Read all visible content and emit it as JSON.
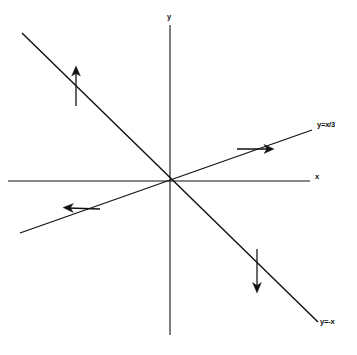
{
  "figure": {
    "kind": "phase-plane-eigenline-diagram",
    "background_color": "#ffffff",
    "stroke_color": "#111111",
    "width": 357,
    "height": 355
  },
  "axes": {
    "x": {
      "label": "x",
      "label_position": {
        "x": 317,
        "y": 177
      },
      "start": {
        "x": 8,
        "y": 181
      },
      "end": {
        "x": 310,
        "y": 181
      }
    },
    "y": {
      "label": "y",
      "label_position": {
        "x": 170,
        "y": 17
      },
      "start": {
        "x": 170,
        "y": 25
      },
      "end": {
        "x": 170,
        "y": 335
      }
    },
    "origin": {
      "x": 170,
      "y": 181
    }
  },
  "lines": [
    {
      "name": "line-y-equals-x-over-3",
      "label": "y=x/3",
      "slope": 0.3333,
      "equation": "y=x/3",
      "label_position": {
        "x": 320,
        "y": 125
      },
      "start": {
        "x": 20,
        "y": 233
      },
      "end": {
        "x": 312,
        "y": 130
      },
      "stroke_width": 1.2
    },
    {
      "name": "line-y-equals-minus-x",
      "label": "y=-x",
      "slope": -1,
      "equation": "y=-x",
      "label_position": {
        "x": 325,
        "y": 322
      },
      "start": {
        "x": 22,
        "y": 33
      },
      "end": {
        "x": 318,
        "y": 322
      },
      "stroke_width": 1.4
    }
  ],
  "direction_arrows": [
    {
      "name": "arrow-up-left-quadrant",
      "direction": "up",
      "on_line": "y=-x",
      "tail": {
        "x": 76,
        "y": 105
      },
      "head": {
        "x": 76,
        "y": 68
      }
    },
    {
      "name": "arrow-right-upper-right-quadrant",
      "direction": "right",
      "on_line": "y=x/3",
      "tail": {
        "x": 238,
        "y": 148
      },
      "head": {
        "x": 272,
        "y": 148
      }
    },
    {
      "name": "arrow-left-lower-left-quadrant",
      "direction": "left",
      "on_line": "y=x/3",
      "tail": {
        "x": 99,
        "y": 209
      },
      "head": {
        "x": 64,
        "y": 206
      }
    },
    {
      "name": "arrow-down-lower-right-quadrant",
      "direction": "down",
      "on_line": "y=-x",
      "tail": {
        "x": 257,
        "y": 249
      },
      "head": {
        "x": 257,
        "y": 290
      }
    }
  ]
}
